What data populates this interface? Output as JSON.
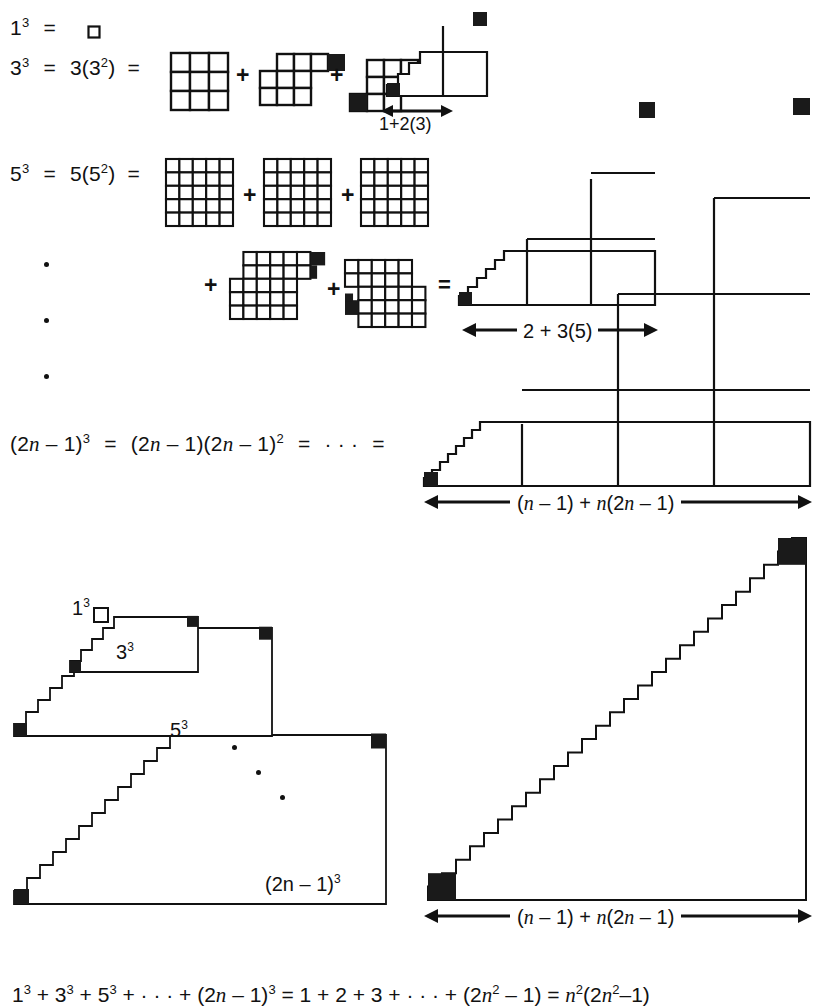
{
  "figure": {
    "kind": "proof-without-words",
    "topic": "sum of cubes of odd numbers",
    "background": "#ffffff",
    "ink": "#111111"
  },
  "rows": {
    "row1": {
      "lhs": "1",
      "lhs_exp": "3",
      "eq1": "=",
      "unit_square_label": "single unit square"
    },
    "row2": {
      "lhs": "3",
      "lhs_exp": "3",
      "eq1": "=",
      "mid": "3(3",
      "mid_exp": "2",
      "mid_close": ")",
      "eq2": "=",
      "plus1": "+",
      "plus2": "+",
      "eq3": "=",
      "grid_n": 3,
      "width_label": "1+2(3)"
    },
    "row3": {
      "lhs": "5",
      "lhs_exp": "3",
      "eq1": "=",
      "mid": "5(5",
      "mid_exp": "2",
      "mid_close": ")",
      "eq2": "=",
      "plus1": "+",
      "plus2": "+",
      "plus3": "+",
      "plus4": "+",
      "eq3": "=",
      "grid_n": 5,
      "width_label": "2 + 3(5)"
    },
    "row4": {
      "lhs_open": "(2",
      "lhs_n": "n",
      "lhs_minus": " – 1)",
      "lhs_exp": "3",
      "eq1": "=",
      "mid_open": "(2",
      "mid_n": "n",
      "mid_minus": " – 1)(2",
      "mid_n2": "n",
      "mid_minus2": " – 1)",
      "mid_exp": "2",
      "eq2": "=",
      "ellipsis": "· · ·",
      "eq3": "=",
      "width_label_a": "(",
      "width_label_n": "n",
      "width_label_b": " – 1) + ",
      "width_label_n2": "n",
      "width_label_c": "(2",
      "width_label_n3": "n",
      "width_label_d": " – 1)"
    }
  },
  "vertical_dots": {
    "count": 3
  },
  "nested_figure": {
    "labels": [
      {
        "base": "1",
        "exp": "3"
      },
      {
        "base": "3",
        "exp": "3"
      },
      {
        "base": "5",
        "exp": "3"
      },
      {
        "base": "(2n – 1)",
        "exp": "3"
      }
    ],
    "diagonal_dots": 3
  },
  "triangle_figure": {
    "steps": 27,
    "width_label": "(n – 1) + n(2n – 1)"
  },
  "bottom_equation": {
    "t1": "1",
    "t1e": "3",
    "p1": " + ",
    "t2": "3",
    "t2e": "3",
    "p2": " + ",
    "t3": "5",
    "t3e": "3",
    "p3": " + · · · + ",
    "t4": "(2",
    "t4n": "n",
    "t4b": " – 1)",
    "t4e": "3",
    "eq1": " = ",
    "s1": "1 + 2 + 3 + · · · + (2",
    "s1n": "n",
    "s1e": "2",
    "s1b": " – 1)",
    "eq2": " = ",
    "r1n": "n",
    "r1e": "2",
    "r1open": "(2",
    "r2n": "n",
    "r2e": "2",
    "r2b": "–1)"
  },
  "colors": {
    "ink": "#111111",
    "fill": "#ffffff",
    "black_cell": "#1a1a1a"
  }
}
